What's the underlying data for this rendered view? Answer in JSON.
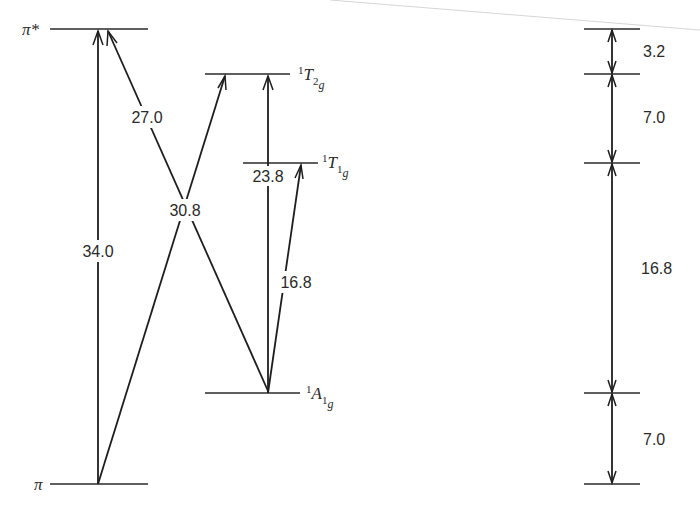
{
  "diagram": {
    "levels": {
      "pi_star": {
        "label": "π*"
      },
      "pi": {
        "label": "π"
      },
      "T2g": {
        "sup": "1",
        "main": "T",
        "sub": "2",
        "subsub": "g"
      },
      "T1g": {
        "sup": "1",
        "main": "T",
        "sub": "1",
        "subsub": "g"
      },
      "A1g": {
        "sup": "1",
        "main": "A",
        "sub": "1",
        "subsub": "g"
      }
    },
    "transitions": {
      "pi_to_pistar": "34.0",
      "A1g_to_pistar": "27.0",
      "pi_to_T2g": "30.8",
      "A1g_to_T2g": "23.8",
      "A1g_to_T1g": "16.8"
    },
    "scale": {
      "gaps": [
        "3.2",
        "7.0",
        "16.8",
        "7.0"
      ]
    }
  }
}
